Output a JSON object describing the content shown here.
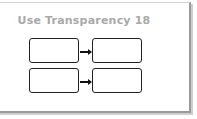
{
  "title": "Use Transparency 18",
  "diagram": {
    "rows": [
      {
        "left_box": "",
        "right_box": ""
      },
      {
        "left_box": "",
        "right_box": ""
      }
    ],
    "colors": {
      "title": "#a9a9a9",
      "box_border": "#222222",
      "frame_border": "#9a9a9a"
    }
  }
}
